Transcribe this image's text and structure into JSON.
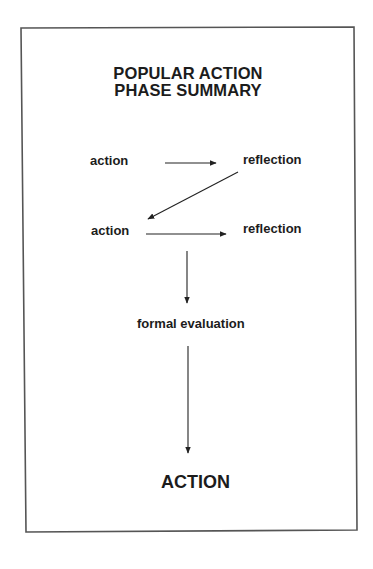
{
  "diagram": {
    "title_line1": "POPULAR ACTION",
    "title_line2": "PHASE SUMMARY",
    "nodes": [
      {
        "id": "action-1",
        "label": "action"
      },
      {
        "id": "reflection-1",
        "label": "reflection"
      },
      {
        "id": "action-2",
        "label": "action"
      },
      {
        "id": "reflection-2",
        "label": "reflection"
      },
      {
        "id": "formal-evaluation",
        "label": "formal evaluation"
      },
      {
        "id": "final-action",
        "label": "ACTION"
      }
    ],
    "edges": [
      {
        "from": "action-1",
        "to": "reflection-1",
        "direction": "right"
      },
      {
        "from": "reflection-1",
        "to": "action-2",
        "direction": "down-left"
      },
      {
        "from": "action-2",
        "to": "reflection-2",
        "direction": "right"
      },
      {
        "from": "action-2",
        "to": "formal-evaluation",
        "direction": "down"
      },
      {
        "from": "formal-evaluation",
        "to": "final-action",
        "direction": "down"
      }
    ],
    "colors": {
      "border": "#555555",
      "text": "#1c1c1c",
      "arrow": "#222222",
      "background": "#ffffff"
    }
  }
}
